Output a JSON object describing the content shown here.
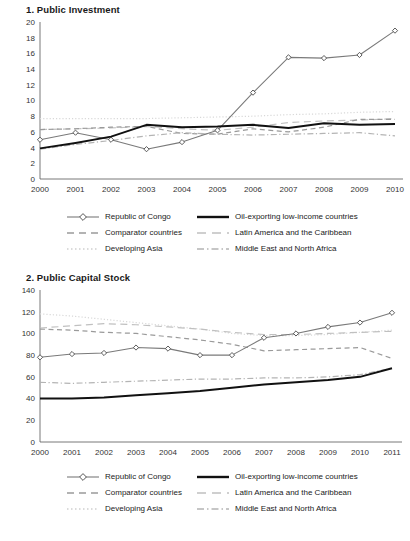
{
  "figure": {
    "background": "#ffffff",
    "series_colors": {
      "republic_of_congo": "#7a7a7a",
      "oil_exporting": "#111111",
      "comparator": "#9a9a9a",
      "latin_america": "#c0c0c0",
      "developing_asia": "#d8d8d8",
      "middle_east": "#b4b4b4"
    }
  },
  "legend": {
    "entries": [
      {
        "label": "Republic of Congo",
        "style": "solid-marker",
        "icon": "line-with-diamond-marker-icon",
        "color": "#7a7a7a"
      },
      {
        "label": "Oil-exporting low-income countries",
        "style": "solid-thick",
        "icon": "thick-solid-line-icon",
        "color": "#111111"
      },
      {
        "label": "Comparator countries",
        "style": "dashed",
        "icon": "dashed-line-icon",
        "color": "#9a9a9a"
      },
      {
        "label": "Latin America and the Caribbean",
        "style": "long-dash",
        "icon": "long-dash-line-icon",
        "color": "#c0c0c0"
      },
      {
        "label": "Developing Asia",
        "style": "dotted",
        "icon": "dotted-line-icon",
        "color": "#d8d8d8"
      },
      {
        "label": "Middle East and North Africa",
        "style": "dash-dot",
        "icon": "dash-dot-line-icon",
        "color": "#b4b4b4"
      }
    ]
  },
  "chart_data": [
    {
      "type": "line",
      "title": "1. Public Investment",
      "xlabel": "",
      "ylabel": "",
      "x": [
        2000,
        2001,
        2002,
        2003,
        2004,
        2005,
        2006,
        2007,
        2008,
        2009,
        2010
      ],
      "xticklabels": [
        "2000",
        "2001",
        "2002",
        "2003",
        "2004",
        "2005",
        "2006",
        "2007",
        "2008",
        "2009",
        "2010"
      ],
      "ylim": [
        0,
        20
      ],
      "yticks": [
        0,
        2,
        4,
        6,
        8,
        10,
        12,
        14,
        16,
        18,
        20
      ],
      "yticklabels": [
        "0",
        "2",
        "4",
        "6",
        "8",
        "10",
        "12",
        "14",
        "16",
        "18",
        "20"
      ],
      "grid": false,
      "legend_position": "below",
      "series": [
        {
          "name": "Republic of Congo",
          "style": "solid-marker",
          "color": "#7a7a7a",
          "values": [
            5.0,
            5.9,
            5.0,
            3.8,
            4.7,
            6.2,
            11.0,
            15.5,
            15.4,
            15.8,
            18.9
          ]
        },
        {
          "name": "Oil-exporting low-income countries",
          "style": "solid-thick",
          "color": "#111111",
          "values": [
            3.9,
            4.6,
            5.4,
            6.9,
            6.6,
            6.7,
            6.9,
            6.5,
            7.1,
            6.9,
            7.0
          ]
        },
        {
          "name": "Comparator countries",
          "style": "dashed",
          "color": "#9a9a9a",
          "values": [
            6.3,
            6.4,
            6.6,
            6.7,
            5.8,
            5.7,
            6.4,
            6.0,
            6.6,
            7.6,
            7.6
          ]
        },
        {
          "name": "Latin America and the Caribbean",
          "style": "long-dash",
          "color": "#c0c0c0",
          "values": [
            6.3,
            6.4,
            6.5,
            6.7,
            6.4,
            6.2,
            6.6,
            7.2,
            7.4,
            7.5,
            7.7
          ]
        },
        {
          "name": "Developing Asia",
          "style": "dotted",
          "color": "#d8d8d8",
          "values": [
            7.7,
            7.7,
            7.7,
            7.7,
            7.8,
            7.9,
            8.0,
            8.2,
            8.3,
            8.5,
            8.6
          ]
        },
        {
          "name": "Middle East and North Africa",
          "style": "dash-dot",
          "color": "#b4b4b4",
          "values": [
            3.8,
            4.4,
            4.9,
            5.5,
            5.9,
            5.7,
            5.6,
            5.7,
            5.8,
            5.9,
            5.5
          ]
        }
      ]
    },
    {
      "type": "line",
      "title": "2. Public Capital Stock",
      "xlabel": "",
      "ylabel": "",
      "x": [
        2000,
        2001,
        2002,
        2003,
        2004,
        2005,
        2006,
        2007,
        2008,
        2009,
        2010,
        2011
      ],
      "xticklabels": [
        "2000",
        "2001",
        "2002",
        "2003",
        "2004",
        "2005",
        "2006",
        "2007",
        "2008",
        "2009",
        "2010",
        "2011"
      ],
      "ylim": [
        0,
        140
      ],
      "yticks": [
        0,
        20,
        40,
        60,
        80,
        100,
        120,
        140
      ],
      "yticklabels": [
        "0",
        "20",
        "40",
        "60",
        "80",
        "100",
        "120",
        "140"
      ],
      "grid": false,
      "legend_position": "below",
      "series": [
        {
          "name": "Republic of Congo",
          "style": "solid-marker",
          "color": "#7a7a7a",
          "values": [
            78,
            81,
            82,
            87,
            86,
            80,
            80,
            96,
            100,
            106,
            110,
            119
          ]
        },
        {
          "name": "Oil-exporting low-income countries",
          "style": "solid-thick",
          "color": "#111111",
          "values": [
            40,
            40,
            41,
            43,
            45,
            47,
            50,
            53,
            55,
            57,
            60,
            68
          ]
        },
        {
          "name": "Comparator countries",
          "style": "dashed",
          "color": "#9a9a9a",
          "values": [
            104,
            103,
            101,
            100,
            97,
            94,
            90,
            84,
            85,
            86,
            87,
            77
          ]
        },
        {
          "name": "Latin America and the Caribbean",
          "style": "long-dash",
          "color": "#c0c0c0",
          "values": [
            105,
            107,
            109,
            108,
            106,
            104,
            101,
            99,
            99,
            100,
            101,
            102
          ]
        },
        {
          "name": "Developing Asia",
          "style": "dotted",
          "color": "#d8d8d8",
          "values": [
            118,
            116,
            113,
            110,
            107,
            104,
            100,
            98,
            98,
            99,
            101,
            103
          ]
        },
        {
          "name": "Middle East and North Africa",
          "style": "dash-dot",
          "color": "#b4b4b4",
          "values": [
            55,
            54,
            55,
            56,
            57,
            58,
            58,
            59,
            59,
            60,
            62,
            68
          ]
        }
      ]
    }
  ]
}
